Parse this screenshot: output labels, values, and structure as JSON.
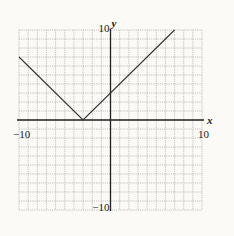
{
  "chart_data": {
    "type": "line",
    "title": "",
    "function": "y = |x + 3|",
    "xlabel": "x",
    "ylabel": "y",
    "xlim": [
      -10,
      10
    ],
    "ylim": [
      -10,
      10
    ],
    "grid": true,
    "grid_step": 1,
    "tick_labels": {
      "x_min": "−10",
      "x_max": "10",
      "y_min": "−10",
      "y_max": "10"
    },
    "series": [
      {
        "name": "absolute value graph",
        "points": [
          {
            "x": -10,
            "y": 7
          },
          {
            "x": -3,
            "y": 0
          },
          {
            "x": 7,
            "y": 10
          }
        ]
      }
    ],
    "vertex": {
      "x": -3,
      "y": 0
    },
    "y_intercept": 3
  },
  "colors": {
    "background": "#fbfaf6",
    "grid": "#9a9a9a",
    "axis": "#222222",
    "line": "#333333"
  }
}
